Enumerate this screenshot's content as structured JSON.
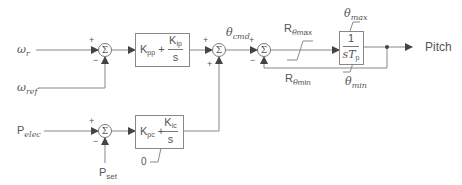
{
  "diagram": {
    "type": "control-block-diagram",
    "inputs": {
      "omega_r": {
        "symbol": "ω",
        "sub": "r"
      },
      "omega_ref": {
        "symbol": "ω",
        "sub": "ref"
      },
      "p_elec": {
        "symbol": "P",
        "sub": "elec"
      },
      "p_set": {
        "symbol": "P",
        "sub": "set"
      },
      "zero": "0"
    },
    "summers": [
      {
        "id": "sum1",
        "glyph": "Σ",
        "signs": [
          "+",
          "−"
        ]
      },
      {
        "id": "sum2",
        "glyph": "Σ",
        "signs": [
          "+",
          "+"
        ]
      },
      {
        "id": "sum3",
        "glyph": "Σ",
        "signs": [
          "+",
          "−"
        ]
      },
      {
        "id": "sum4",
        "glyph": "Σ",
        "signs": [
          "+",
          "−"
        ]
      }
    ],
    "blocks": {
      "pi_speed": {
        "k_prop": "K",
        "k_prop_sub": "pp",
        "plus": "+",
        "k_int": "K",
        "k_int_sub": "ip",
        "den": "s"
      },
      "pi_power": {
        "k_prop": "K",
        "k_prop_sub": "pc",
        "plus": "+",
        "k_int": "K",
        "k_int_sub": "ic",
        "den": "s",
        "lower_limit": "0"
      },
      "integrator": {
        "num": "1",
        "den": "sT",
        "den_sub": "p"
      }
    },
    "signals": {
      "theta_cmd": {
        "symbol": "θ",
        "sub": "cmd"
      },
      "r_theta_max": {
        "symbol": "R",
        "sub_symbol": "θ",
        "sub": "max"
      },
      "r_theta_min": {
        "symbol": "R",
        "sub_symbol": "θ",
        "sub": "min"
      },
      "theta_max": {
        "symbol": "θ",
        "sub": "max"
      },
      "theta_min": {
        "symbol": "θ",
        "sub": "min"
      },
      "output": "Pitch"
    },
    "signs": {
      "plus": "+",
      "minus": "−"
    }
  }
}
